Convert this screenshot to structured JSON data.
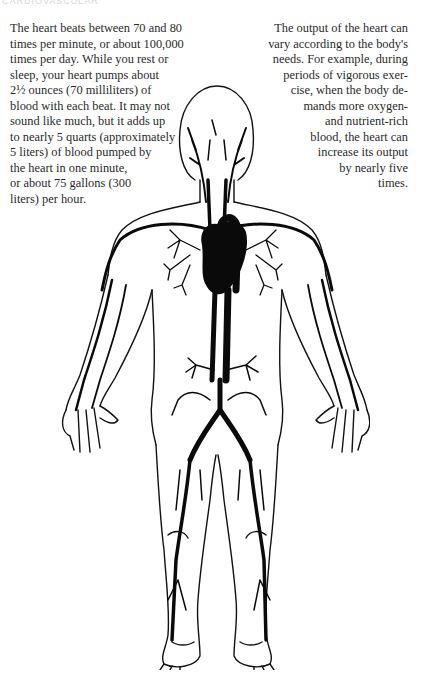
{
  "page": {
    "header_fragment": "CARDIOVASCULAR",
    "background": "#ffffff",
    "text_color": "#2a2a2a"
  },
  "left_column": {
    "lines": [
      "The heart beats between 70 and 80",
      "times per minute, or about 100,000",
      "times per day. While you rest or",
      "sleep, your heart pumps about",
      "2½ ounces (70 milliliters) of",
      "blood with each beat. It may not",
      "sound like much, but it adds up",
      "to nearly 5 quarts (approximately",
      "5 liters) of blood pumped by",
      "the heart in one minute,",
      "or about 75 gallons (300",
      "liters) per hour."
    ]
  },
  "right_column": {
    "lines": [
      "The output of the heart can",
      "vary according to the body's",
      "needs. For example, during",
      "periods of vigorous exer-",
      "cise, when the body de-",
      "mands more oxygen-",
      "and nutrient-rich",
      "blood, the heart can",
      "increase its output",
      "by nearly five",
      "times."
    ]
  },
  "figure": {
    "parts": [
      "head",
      "heart",
      "lungs",
      "aorta",
      "arms",
      "hands",
      "legs",
      "feet"
    ],
    "ink_color": "#0a0a0a"
  }
}
